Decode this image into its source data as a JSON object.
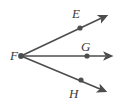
{
  "figure": {
    "type": "geometry-diagram",
    "background_color": "#ffffff",
    "stroke_color": "#4d4d4d",
    "label_color": "#3a3a3a",
    "vertex": {
      "name": "F",
      "label": "F",
      "x": 21,
      "y": 56,
      "label_x": 10,
      "label_y": 49
    },
    "points": [
      {
        "name": "E",
        "label": "E",
        "x": 80,
        "y": 28,
        "label_x": 72,
        "label_y": 7,
        "ray_tip_x": 106,
        "ray_tip_y": 16
      },
      {
        "name": "G",
        "label": "G",
        "x": 87,
        "y": 56,
        "label_x": 81,
        "label_y": 40,
        "ray_tip_x": 111,
        "ray_tip_y": 56
      },
      {
        "name": "H",
        "label": "H",
        "x": 81,
        "y": 80,
        "label_x": 69,
        "label_y": 87,
        "ray_tip_x": 105,
        "ray_tip_y": 91
      }
    ],
    "rays": [
      {
        "name": "ray-FE",
        "from": "F",
        "through": "E"
      },
      {
        "name": "ray-FG",
        "from": "F",
        "through": "G"
      },
      {
        "name": "ray-FH",
        "from": "F",
        "through": "H"
      }
    ]
  }
}
